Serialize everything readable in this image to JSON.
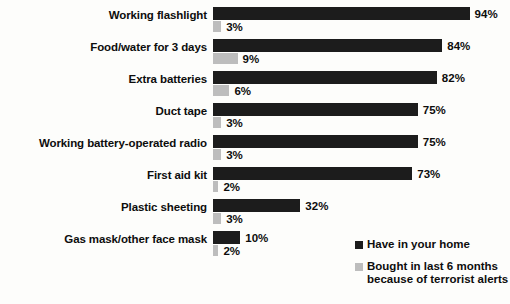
{
  "chart_data": {
    "type": "bar",
    "orientation": "horizontal",
    "title": "",
    "subtitle": "",
    "xlabel": "",
    "ylabel": "",
    "grid": false,
    "xlim": [
      0,
      100
    ],
    "value_suffix": "%",
    "legend_position": "bottom-right",
    "categories": [
      "Working flashlight",
      "Food/water for 3 days",
      "Extra batteries",
      "Duct tape",
      "Working battery-operated radio",
      "First aid kit",
      "Plastic sheeting",
      "Gas mask/other face mask"
    ],
    "series": [
      {
        "name": "Have in your home",
        "color": "#1c1c1c",
        "values": [
          94,
          84,
          82,
          75,
          75,
          73,
          32,
          10
        ],
        "labels": [
          "94%",
          "84%",
          "82%",
          "75%",
          "75%",
          "73%",
          "32%",
          "10%"
        ]
      },
      {
        "name": "Bought in last 6 months because of terrorist alerts",
        "color": "#bdbdbd",
        "values": [
          3,
          9,
          6,
          3,
          3,
          2,
          3,
          2
        ],
        "labels": [
          "3%",
          "9%",
          "6%",
          "3%",
          "3%",
          "2%",
          "3%",
          "2%"
        ]
      }
    ]
  },
  "legend": {
    "items": [
      {
        "label": "Have in your home",
        "label2": "",
        "color": "#1c1c1c"
      },
      {
        "label": "Bought in last 6 months",
        "label2": "because of terrorist alerts",
        "color": "#bdbdbd"
      }
    ]
  }
}
